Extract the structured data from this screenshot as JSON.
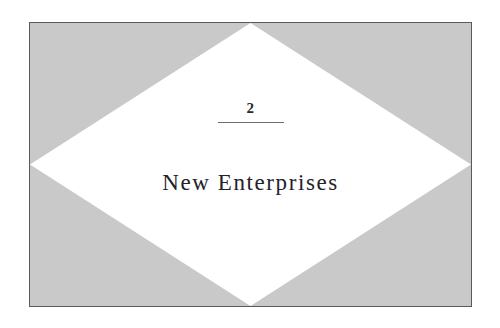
{
  "page": {
    "background_color": "#ffffff",
    "width": 500,
    "height": 328
  },
  "panel": {
    "fill_color": "#c9c9c9",
    "border_color": "#5a5a5a"
  },
  "diamond": {
    "fill_color": "#ffffff",
    "shape": "rhombus-apexes-at-edge-midpoints"
  },
  "chapter": {
    "number": "2",
    "title": "New Enterprises",
    "rule_color": "#6e6e6e",
    "text_color": "#23232a"
  }
}
